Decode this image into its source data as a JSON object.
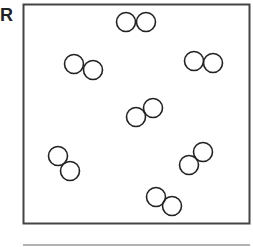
{
  "panel": {
    "label": "R",
    "box": {
      "x": 23.5,
      "y": 4.5,
      "width": 226,
      "height": 219,
      "stroke": "#444444"
    },
    "molecule_style": {
      "radius": 9.5,
      "stroke": "#222222",
      "stroke_width": 1.6
    },
    "molecules": [
      {
        "a": [
          126,
          22
        ],
        "b": [
          146,
          22
        ]
      },
      {
        "a": [
          74,
          64
        ],
        "b": [
          93,
          70
        ]
      },
      {
        "a": [
          194,
          61
        ],
        "b": [
          213,
          63
        ]
      },
      {
        "a": [
          136,
          117
        ],
        "b": [
          153,
          108
        ]
      },
      {
        "a": [
          58,
          156
        ],
        "b": [
          70,
          171
        ]
      },
      {
        "a": [
          189,
          165
        ],
        "b": [
          203,
          152
        ]
      },
      {
        "a": [
          156,
          197
        ],
        "b": [
          172,
          206
        ]
      }
    ],
    "bottom_line": {
      "x1": 23,
      "y1": 245,
      "x2": 250,
      "y2": 245,
      "stroke": "#999999"
    }
  }
}
